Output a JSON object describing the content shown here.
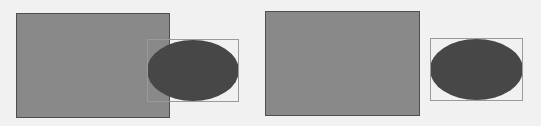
{
  "diagram": {
    "background": "#f1f1f1",
    "panels": [
      {
        "name": "overlapping",
        "rectangle": {
          "x": 16,
          "y": 13,
          "w": 154,
          "h": 105,
          "fill": "#898989",
          "stroke": "#4e4e4e"
        },
        "bounding_box": {
          "x": 147,
          "y": 39,
          "w": 92,
          "h": 63,
          "stroke": "#9a9a9a"
        },
        "ellipse": {
          "x": 147,
          "y": 40,
          "w": 92,
          "h": 61,
          "fill": "#474747"
        }
      },
      {
        "name": "separated",
        "rectangle": {
          "x": 265,
          "y": 11,
          "w": 155,
          "h": 105,
          "fill": "#898989",
          "stroke": "#4e4e4e"
        },
        "bounding_box": {
          "x": 430,
          "y": 38,
          "w": 93,
          "h": 63,
          "stroke": "#9a9a9a"
        },
        "ellipse": {
          "x": 430,
          "y": 39,
          "w": 93,
          "h": 61,
          "fill": "#474747"
        }
      }
    ]
  }
}
